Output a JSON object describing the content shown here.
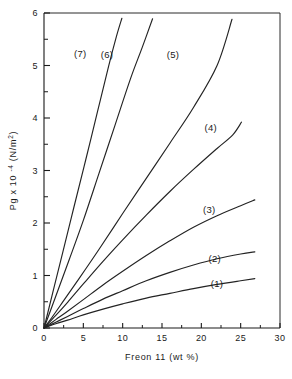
{
  "chart_data": {
    "type": "line",
    "title": "",
    "xlabel": "Freon 11 (wt %)",
    "ylabel_main": "Pg x 10",
    "ylabel_exp": "-4",
    "ylabel_unit": "(N/m",
    "ylabel_unit_exp": "2",
    "ylabel_unit_close": ")",
    "ylabel_full": "Pg x 10-4 (N/m2)",
    "xlim": [
      0,
      30
    ],
    "ylim": [
      0,
      6
    ],
    "xticks": [
      0,
      5,
      10,
      15,
      20,
      25,
      30
    ],
    "xtick_labels": [
      "0",
      "5",
      "10",
      "15",
      "20",
      "25",
      "30"
    ],
    "xminor_step": 2.5,
    "yticks": [
      0,
      1,
      2,
      3,
      4,
      5,
      6
    ],
    "ytick_labels": [
      "0",
      "1",
      "2",
      "3",
      "4",
      "5",
      "6"
    ],
    "yminor_step": 0.5,
    "grid": false,
    "legend": "inline-labels",
    "series": [
      {
        "name": "(1)",
        "label": "(1)",
        "label_x": 22.0,
        "label_y": 0.78,
        "x": [
          0,
          1.5,
          3,
          5,
          7.5,
          10,
          13,
          16,
          19,
          22,
          25,
          26.8
        ],
        "y": [
          0,
          0.08,
          0.15,
          0.25,
          0.36,
          0.46,
          0.57,
          0.66,
          0.75,
          0.83,
          0.9,
          0.94
        ]
      },
      {
        "name": "(2)",
        "label": "(2)",
        "label_x": 21.7,
        "label_y": 1.25,
        "x": [
          0,
          1.5,
          3,
          5,
          7.5,
          10,
          13,
          16,
          19,
          22,
          25,
          26.8
        ],
        "y": [
          0,
          0.11,
          0.22,
          0.37,
          0.55,
          0.71,
          0.9,
          1.06,
          1.2,
          1.32,
          1.41,
          1.45
        ]
      },
      {
        "name": "(3)",
        "label": "(3)",
        "label_x": 21.0,
        "label_y": 2.2,
        "x": [
          0,
          1.5,
          3,
          5,
          7.5,
          10,
          13,
          16,
          19,
          22,
          25,
          26.8
        ],
        "y": [
          0,
          0.16,
          0.32,
          0.54,
          0.82,
          1.08,
          1.38,
          1.66,
          1.92,
          2.14,
          2.33,
          2.44
        ]
      },
      {
        "name": "(4)",
        "label": "(4)",
        "label_x": 21.2,
        "label_y": 3.75,
        "x": [
          0,
          1.5,
          3,
          5,
          7.5,
          10,
          13,
          16,
          19,
          22,
          24,
          25.1
        ],
        "y": [
          0,
          0.24,
          0.49,
          0.84,
          1.27,
          1.68,
          2.15,
          2.6,
          3.02,
          3.42,
          3.68,
          3.92
        ]
      },
      {
        "name": "(5)",
        "label": "(5)",
        "label_x": 16.4,
        "label_y": 5.15,
        "x": [
          0,
          1,
          2.5,
          4.5,
          7,
          10,
          13,
          16,
          19,
          22,
          23.9
        ],
        "y": [
          0,
          0.2,
          0.52,
          0.95,
          1.5,
          2.18,
          2.85,
          3.52,
          4.2,
          5.0,
          5.88
        ]
      },
      {
        "name": "(6)",
        "label": "(6)",
        "label_x": 8.0,
        "label_y": 5.15,
        "x": [
          0,
          0.7,
          1.8,
          3.2,
          5,
          7,
          9,
          11,
          12.5,
          13.8
        ],
        "y": [
          0,
          0.28,
          0.73,
          1.3,
          2.05,
          2.95,
          3.85,
          4.75,
          5.35,
          5.89
        ]
      },
      {
        "name": "(7)",
        "label": "(7)",
        "label_x": 4.6,
        "label_y": 5.17,
        "x": [
          0,
          0.5,
          1.3,
          2.4,
          3.8,
          5.3,
          6.8,
          8.2,
          9.2,
          9.9
        ],
        "y": [
          0,
          0.3,
          0.79,
          1.45,
          2.3,
          3.2,
          4.12,
          4.98,
          5.55,
          5.9
        ]
      }
    ]
  }
}
